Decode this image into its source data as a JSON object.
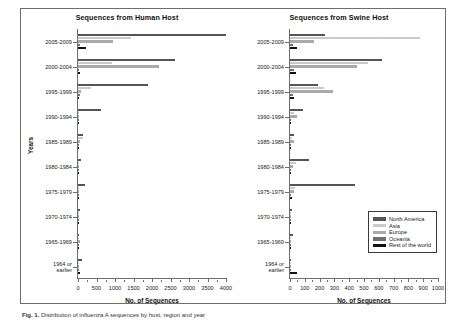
{
  "figure": {
    "caption_label": "Fig. 1.",
    "caption_text": "Distribution of influenza A sequences by host, region and year"
  },
  "axis": {
    "y_title": "Years",
    "x_title": "No. of Sequences"
  },
  "legend": {
    "position": "bottom-right",
    "items": [
      {
        "label": "North America",
        "color": "#555555"
      },
      {
        "label": "Asia",
        "color": "#c9c9c9"
      },
      {
        "label": "Europe",
        "color": "#aaaaaa"
      },
      {
        "label": "Oceania",
        "color": "#6f6f6f"
      },
      {
        "label": "Rest of the world",
        "color": "#111111"
      }
    ]
  },
  "chart_data": [
    {
      "type": "bar",
      "orientation": "horizontal",
      "title": "Sequences from Human Host",
      "xlabel": "No. of Sequences",
      "ylabel": "Years",
      "xlim": [
        0,
        4000
      ],
      "xticks": [
        0,
        500,
        1000,
        1500,
        2000,
        2500,
        3000,
        3500,
        4000
      ],
      "grid": false,
      "legend_position": "none",
      "categories": [
        "2005-2009",
        "2000-2004",
        "1995-1999",
        "1990-1994",
        "1985-1989",
        "1980-1984",
        "1975-1979",
        "1970-1974",
        "1965-1969",
        "1964 or\nearlier"
      ],
      "series": [
        {
          "name": "North America",
          "color": "#555555",
          "values": [
            4000,
            2620,
            1900,
            620,
            140,
            70,
            190,
            60,
            30,
            120
          ]
        },
        {
          "name": "Asia",
          "color": "#c9c9c9",
          "values": [
            1430,
            910,
            350,
            20,
            130,
            30,
            25,
            15,
            10,
            15
          ]
        },
        {
          "name": "Europe",
          "color": "#aaaaaa",
          "values": [
            940,
            2200,
            70,
            15,
            60,
            25,
            30,
            10,
            60,
            20
          ]
        },
        {
          "name": "Oceania",
          "color": "#6f6f6f",
          "values": [
            45,
            35,
            60,
            10,
            15,
            10,
            15,
            5,
            5,
            5
          ]
        },
        {
          "name": "Rest of the world",
          "color": "#111111",
          "values": [
            210,
            45,
            30,
            8,
            12,
            8,
            30,
            8,
            20,
            50
          ]
        }
      ]
    },
    {
      "type": "bar",
      "orientation": "horizontal",
      "title": "Sequences from Swine Host",
      "xlabel": "No. of Sequences",
      "ylabel": "Years",
      "xlim": [
        0,
        1000
      ],
      "xticks": [
        0,
        100,
        200,
        300,
        400,
        500,
        600,
        700,
        800,
        900,
        1000
      ],
      "grid": false,
      "legend_position": "bottom-right",
      "categories": [
        "2005-2009",
        "2000-2004",
        "1995-1999",
        "1990-1994",
        "1985-1989",
        "1980-1984",
        "1975-1979",
        "1970-1974",
        "1965-1969",
        "1964 or\nearlier"
      ],
      "series": [
        {
          "name": "North America",
          "color": "#555555",
          "values": [
            235,
            620,
            190,
            85,
            30,
            130,
            440,
            15,
            20,
            10
          ]
        },
        {
          "name": "Asia",
          "color": "#c9c9c9",
          "values": [
            880,
            530,
            230,
            30,
            12,
            40,
            35,
            8,
            10,
            8
          ]
        },
        {
          "name": "Europe",
          "color": "#aaaaaa",
          "values": [
            160,
            450,
            290,
            45,
            25,
            20,
            25,
            8,
            6,
            5
          ]
        },
        {
          "name": "Oceania",
          "color": "#6f6f6f",
          "values": [
            20,
            30,
            20,
            10,
            6,
            8,
            10,
            4,
            4,
            4
          ]
        },
        {
          "name": "Rest of the world",
          "color": "#111111",
          "values": [
            45,
            40,
            25,
            10,
            6,
            10,
            12,
            5,
            5,
            45
          ]
        }
      ]
    }
  ]
}
